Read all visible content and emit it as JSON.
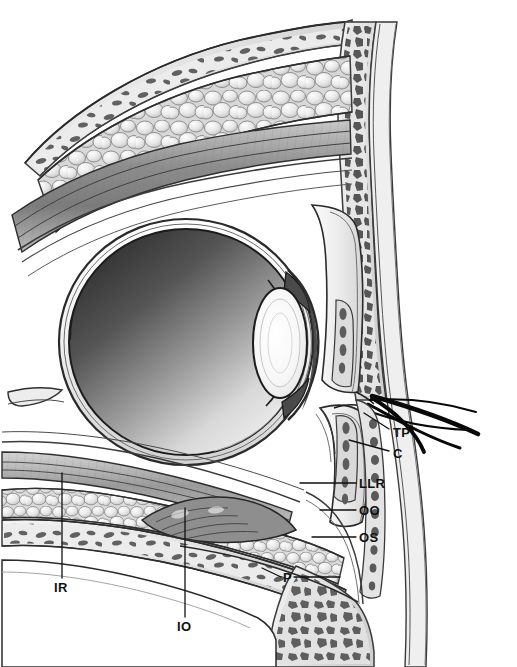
{
  "figure": {
    "background_color": "#ffffff",
    "width": 517,
    "height": 667,
    "rendering": "grayscale medical illustration, pen-and-ink with airbrush shading"
  },
  "palette": {
    "background": "#ffffff",
    "ink": "#111111",
    "bone_cortex": "#e9e9e9",
    "bone_marrow_cell": "#5e5e5e",
    "marrow_space": "#dcdcdc",
    "fat_lobule_light": "#f2f2f2",
    "fat_lobule_mid": "#d6d6d6",
    "fat_outline": "#8a8a8a",
    "muscle_dark": "#8f8f8f",
    "muscle_mid": "#b4b4b4",
    "sclera": "#f6f6f6",
    "vitreous_dark": "#3a3a3a",
    "vitreous_light": "#f0f0f0",
    "lens_highlight": "#fbfbfb",
    "lash_black": "#0a0a0a",
    "leader_line": "#111111"
  },
  "labels": [
    {
      "id": "tp",
      "text": "TP",
      "full_name": "tarsal plate",
      "x": 393,
      "y": 426,
      "leader": {
        "x1": 389,
        "y1": 429,
        "x2": 364,
        "y2": 413
      }
    },
    {
      "id": "c",
      "text": "C",
      "full_name": "conjunctiva",
      "x": 393,
      "y": 447,
      "leader": {
        "x1": 389,
        "y1": 451,
        "x2": 349,
        "y2": 440
      }
    },
    {
      "id": "llr",
      "text": "LLR",
      "full_name": "levator aponeurosis / lower lid retractors",
      "x": 359,
      "y": 479,
      "leader": {
        "x1": 356,
        "y1": 483,
        "x2": 300,
        "y2": 483
      }
    },
    {
      "id": "oo",
      "text": "OO",
      "full_name": "orbicularis oculi muscle",
      "x": 359,
      "y": 506,
      "leader": {
        "x1": 356,
        "y1": 510,
        "x2": 320,
        "y2": 510
      }
    },
    {
      "id": "os",
      "text": "OS",
      "full_name": "orbital septum",
      "x": 359,
      "y": 533,
      "leader": {
        "x1": 356,
        "y1": 537,
        "x2": 312,
        "y2": 537
      }
    },
    {
      "id": "p",
      "text": "P",
      "full_name": "periosteum / periorbita",
      "x": 284,
      "y": 573,
      "leader": {
        "x1": 281,
        "y1": 577,
        "x2": 262,
        "y2": 568
      },
      "leader2": {
        "x1": 294,
        "y1": 577,
        "x2": 340,
        "y2": 577
      }
    },
    {
      "id": "ir",
      "text": "IR",
      "full_name": "inferior rectus muscle",
      "x": 55,
      "y": 583,
      "leader": {
        "x1": 62,
        "y1": 578,
        "x2": 62,
        "y2": 473
      }
    },
    {
      "id": "io",
      "text": "IO",
      "full_name": "inferior oblique muscle",
      "x": 178,
      "y": 622,
      "leader": {
        "x1": 185,
        "y1": 617,
        "x2": 185,
        "y2": 508
      }
    }
  ],
  "structures": [
    {
      "id": "orbital-roof-bone",
      "name": "orbital roof bone with marrow"
    },
    {
      "id": "superior-orbital-fat",
      "name": "superior orbital fat pad"
    },
    {
      "id": "superior-rectus-levator",
      "name": "superior rectus and levator palpebrae complex"
    },
    {
      "id": "globe",
      "name": "globe (eyeball)"
    },
    {
      "id": "sclera",
      "name": "sclera"
    },
    {
      "id": "cornea",
      "name": "cornea"
    },
    {
      "id": "lens",
      "name": "lens"
    },
    {
      "id": "iris",
      "name": "iris"
    },
    {
      "id": "upper-eyelid",
      "name": "upper eyelid"
    },
    {
      "id": "lower-eyelid",
      "name": "lower eyelid"
    },
    {
      "id": "eyelashes",
      "name": "eyelashes"
    },
    {
      "id": "inferior-orbital-fat",
      "name": "inferior orbital fat pad"
    },
    {
      "id": "inferior-rectus",
      "name": "inferior rectus muscle"
    },
    {
      "id": "inferior-oblique",
      "name": "inferior oblique muscle"
    },
    {
      "id": "orbital-floor-bone",
      "name": "orbital floor bone with marrow"
    },
    {
      "id": "maxillary-sinus",
      "name": "maxillary sinus"
    },
    {
      "id": "facial-soft-tissue",
      "name": "anterior facial soft tissue and bone"
    }
  ]
}
